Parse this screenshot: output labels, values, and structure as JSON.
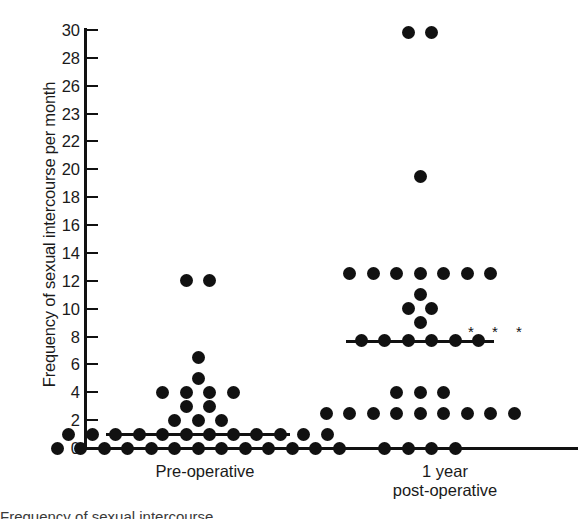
{
  "chart_data": {
    "type": "scatter",
    "title": "",
    "xlabel": "",
    "ylabel": "Frequency of sexual intercourse per month",
    "ylim": [
      0,
      30
    ],
    "grid": false,
    "legend": "none",
    "ytick_labels": [
      "30",
      "28",
      "26",
      "23",
      "22",
      "20",
      "18",
      "16",
      "14",
      "12",
      "10",
      "8",
      "6",
      "4",
      "2",
      "0"
    ],
    "ytick_values": [
      30,
      28,
      26,
      23,
      22,
      20,
      18,
      16,
      14,
      12,
      10,
      8,
      6,
      4,
      2,
      0
    ],
    "categories": [
      "Pre-operative",
      "1 year post-operative"
    ],
    "annotations": [
      "* * *"
    ],
    "groups": [
      {
        "name": "Pre-operative",
        "label_lines": [
          "Pre-operative"
        ],
        "median": 1.0,
        "n": 38,
        "significance": "",
        "stacks": [
          {
            "value": 12.0,
            "count": 2
          },
          {
            "value": 6.5,
            "count": 1
          },
          {
            "value": 5.0,
            "count": 1
          },
          {
            "value": 4.0,
            "count": 4
          },
          {
            "value": 3.0,
            "count": 2
          },
          {
            "value": 2.0,
            "count": 3
          },
          {
            "value": 1.0,
            "count": 12
          },
          {
            "value": 0.0,
            "count": 13
          }
        ]
      },
      {
        "name": "1 year post-operative",
        "label_lines": [
          "1 year",
          "post-operative"
        ],
        "median": 7.7,
        "n": 36,
        "significance": "* * *",
        "stacks": [
          {
            "value": 29.8,
            "count": 2
          },
          {
            "value": 19.5,
            "count": 1
          },
          {
            "value": 12.5,
            "count": 7
          },
          {
            "value": 11.0,
            "count": 1
          },
          {
            "value": 10.0,
            "count": 2
          },
          {
            "value": 9.0,
            "count": 1
          },
          {
            "value": 7.7,
            "count": 6
          },
          {
            "value": 4.0,
            "count": 3
          },
          {
            "value": 2.5,
            "count": 9
          },
          {
            "value": 0.0,
            "count": 4
          }
        ]
      }
    ]
  },
  "colors": {
    "dot": "#111111",
    "axis": "#111111",
    "text": "#1a1a1a",
    "background": "#ffffff"
  },
  "caption": {
    "text": "Frequency of sexual intercourse"
  }
}
